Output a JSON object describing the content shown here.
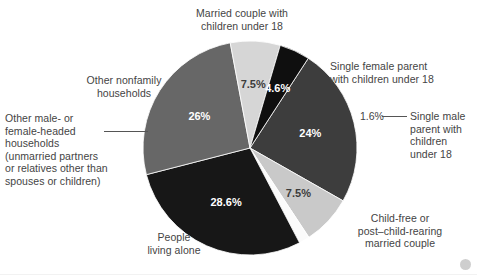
{
  "chart_data": {
    "type": "pie",
    "title": "",
    "subtitle": "",
    "xlabel": "",
    "ylabel": "",
    "legend_position": "callout-labels",
    "grid": false,
    "total": 100,
    "start_angle_deg": -57,
    "direction": "clockwise",
    "categories": [
      "Married couple with children under 18",
      "Single female parent with children under 18",
      "Single male parent with children under 18",
      "Child-free or post–child-rearing married couple",
      "People living alone",
      "Other male- or female-headed households (unmarried partners or relatives other than spouses or children)",
      "Other nonfamily households"
    ],
    "values": [
      24,
      7.5,
      1.6,
      28.6,
      26,
      7.5,
      4.6
    ],
    "value_labels": [
      "24%",
      "7.5%",
      "1.6%",
      "28.6%",
      "26%",
      "7.5%",
      "4.6%"
    ],
    "colors": [
      "#3d3d3d",
      "#c9c9c9",
      "#fbfbfb",
      "#171717",
      "#676767",
      "#d6d6d6",
      "#0f0f0f"
    ],
    "label_text_colors": [
      "#ffffff",
      "#3c3c3c",
      "#444444",
      "#ffffff",
      "#ffffff",
      "#3c3c3c",
      "#ffffff"
    ],
    "slices": [
      {
        "name": "married-couple-with-children",
        "label": "Married couple with\nchildren under 18",
        "value": 24,
        "value_label": "24%",
        "color": "#3d3d3d",
        "text_color": "#ffffff",
        "label_outside": true,
        "leader": false
      },
      {
        "name": "single-female-parent",
        "label": "Single female parent\nwith children under 18",
        "value": 7.5,
        "value_label": "7.5%",
        "color": "#c9c9c9",
        "text_color": "#3c3c3c",
        "label_outside": true,
        "leader": false
      },
      {
        "name": "single-male-parent",
        "label": "Single male\nparent with\nchildren\nunder 18",
        "value": 1.6,
        "value_label": "1.6%",
        "color": "#fbfbfb",
        "text_color": "#444444",
        "label_outside": true,
        "leader": true
      },
      {
        "name": "child-free-or-post-child-rearing",
        "label": "Child-free or\npost–child-rearing\nmarried couple",
        "value": 28.6,
        "value_label": "28.6%",
        "color": "#171717",
        "text_color": "#ffffff",
        "label_outside": true,
        "leader": false
      },
      {
        "name": "people-living-alone",
        "label": "People\nliving alone",
        "value": 26,
        "value_label": "26%",
        "color": "#676767",
        "text_color": "#ffffff",
        "label_outside": true,
        "leader": false
      },
      {
        "name": "other-male-or-female-headed",
        "label": "Other male- or\nfemale-headed\nhouseholds\n(unmarried partners\nor relatives other than\nspouses or children)",
        "value": 7.5,
        "value_label": "7.5%",
        "color": "#d6d6d6",
        "text_color": "#3c3c3c",
        "label_outside": true,
        "leader": true
      },
      {
        "name": "other-nonfamily-households",
        "label": "Other nonfamily\nhouseholds",
        "value": 4.6,
        "value_label": "4.6%",
        "color": "#0f0f0f",
        "text_color": "#ffffff",
        "label_outside": true,
        "leader": false
      }
    ]
  },
  "labels": {
    "married_couple": "Married couple with\nchildren under 18",
    "single_female_parent": "Single female parent\nwith children under 18",
    "single_male_parent": "Single male\nparent with\nchildren\nunder 18",
    "child_free": "Child-free or\npost–child-rearing\nmarried couple",
    "people_living_alone": "People\nliving alone",
    "other_male_female_headed": "Other male- or\nfemale-headed\nhouseholds\n(unmarried partners\nor relatives other than\nspouses or children)",
    "other_nonfamily": "Other nonfamily\nhouseholds"
  },
  "percent_labels": {
    "married_couple": "24%",
    "single_female_parent": "7.5%",
    "single_male_parent": "1.6%",
    "child_free": "28.6%",
    "people_living_alone": "26%",
    "other_male_female_headed": "7.5%",
    "other_nonfamily": "4.6%"
  },
  "style": {
    "background": "#ffffff",
    "text_color": "#444444"
  }
}
